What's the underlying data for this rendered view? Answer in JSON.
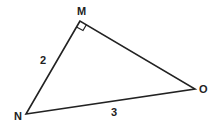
{
  "figure": {
    "type": "right-triangle",
    "vertices": [
      {
        "name": "M",
        "x": 80,
        "y": 21,
        "label_x": 77,
        "label_y": 15
      },
      {
        "name": "N",
        "x": 26,
        "y": 114,
        "label_x": 14,
        "label_y": 120
      },
      {
        "name": "O",
        "x": 195,
        "y": 89,
        "label_x": 199,
        "label_y": 93
      }
    ],
    "right_angle_at": "M",
    "sides": [
      {
        "from": "M",
        "to": "N",
        "length_label": "2",
        "label_x": 40,
        "label_y": 64
      },
      {
        "from": "N",
        "to": "O",
        "length_label": "3",
        "label_x": 111,
        "label_y": 116
      },
      {
        "from": "M",
        "to": "O",
        "length_label": ""
      }
    ],
    "stroke_color": "#222222"
  }
}
